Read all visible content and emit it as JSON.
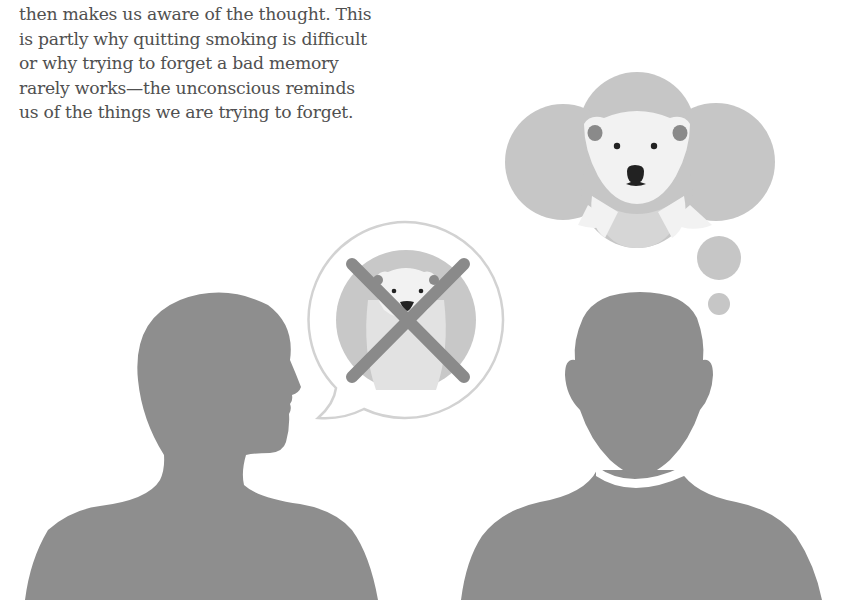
{
  "text": {
    "lines": [
      "then makes us aware of the thought. This",
      "is partly why quitting smoking is difficult",
      "or why trying to forget a bad memory",
      "rarely works—the unconscious reminds",
      "us of the things we are trying to forget."
    ]
  },
  "illustration": {
    "figures": [
      {
        "name": "speaking-person",
        "view": "profile",
        "bubble": "speech",
        "bubble_content": "polar bear crossed out"
      },
      {
        "name": "thinking-person",
        "view": "front",
        "bubble": "thought",
        "bubble_content": "polar bear"
      }
    ],
    "colors": {
      "silhouette": "#8e8e8e",
      "cloud": "#c6c6c6",
      "bear_white": "#f2f2f2",
      "bear_shade": "#d6d6d6",
      "bear_ear": "#8a8a8a",
      "bear_nose": "#222222",
      "cross": "#8a8a8a",
      "speech_outline": "#d2d2d2",
      "text": "#505050"
    }
  }
}
